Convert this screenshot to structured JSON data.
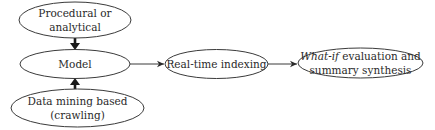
{
  "diagram": {
    "nodes": {
      "procedural": {
        "line1": "Procedural or",
        "line2": "analytical"
      },
      "model": {
        "label": "Model"
      },
      "data_mining": {
        "line1": "Data mining based",
        "line2": "(crawling)"
      },
      "indexing": {
        "label": "Real-time indexing"
      },
      "whatif": {
        "line1_italic": "What-if",
        "line1_rest": " evaluation and",
        "line2": "summary synthesis"
      }
    },
    "edges": [
      {
        "from": "Procedural or analytical",
        "to": "Model",
        "style": "bold"
      },
      {
        "from": "Data mining based (crawling)",
        "to": "Model",
        "style": "bold"
      },
      {
        "from": "Model",
        "to": "Real-time indexing",
        "style": "thin"
      },
      {
        "from": "Real-time indexing",
        "to": "What-if evaluation and summary synthesis",
        "style": "thin"
      }
    ],
    "colors": {
      "stroke": "#3a3a3a",
      "text": "#2a2a2a",
      "background": "#ffffff"
    }
  }
}
